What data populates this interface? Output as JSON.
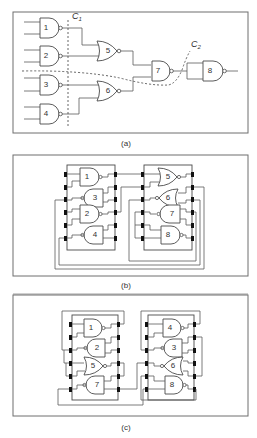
{
  "figure": {
    "panels": [
      {
        "id": "a",
        "caption": "(a)",
        "description": "Logic circuit of 8 gates with two partition cuts",
        "gates": [
          {
            "label": "1",
            "type": "NAND"
          },
          {
            "label": "2",
            "type": "NAND"
          },
          {
            "label": "3",
            "type": "NAND"
          },
          {
            "label": "4",
            "type": "NAND"
          },
          {
            "label": "5",
            "type": "NOR"
          },
          {
            "label": "6",
            "type": "NOR"
          },
          {
            "label": "7",
            "type": "NAND"
          },
          {
            "label": "8",
            "type": "NAND"
          }
        ],
        "cuts": [
          {
            "name": "C",
            "sub": "1"
          },
          {
            "name": "C",
            "sub": "2"
          }
        ]
      },
      {
        "id": "b",
        "caption": "(b)",
        "description": "Placement on two chips per cut C1",
        "chips": [
          {
            "gates": [
              "1",
              "3",
              "2",
              "4"
            ]
          },
          {
            "gates": [
              "5",
              "6",
              "7",
              "8"
            ]
          }
        ]
      },
      {
        "id": "c",
        "caption": "(c)",
        "description": "Placement on two chips per cut C2",
        "chips": [
          {
            "gates": [
              "1",
              "2",
              "5",
              "7"
            ]
          },
          {
            "gates": [
              "4",
              "3",
              "6",
              "8"
            ]
          }
        ]
      }
    ]
  }
}
